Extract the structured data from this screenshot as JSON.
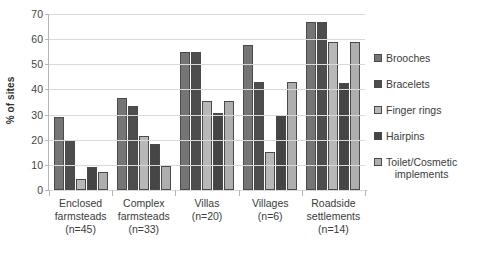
{
  "chart_data": {
    "type": "bar",
    "title": "",
    "xlabel": "",
    "ylabel": "% of sites",
    "ylim": [
      0,
      70
    ],
    "yticks": [
      0,
      10,
      20,
      30,
      40,
      50,
      60,
      70
    ],
    "grid": true,
    "legend_position": "right",
    "categories": [
      "Enclosed farmsteads (n=45)",
      "Complex farmsteads (n=33)",
      "Villas (n=20)",
      "Villages (n=6)",
      "Roadside settlements (n=14)"
    ],
    "category_lines": [
      [
        "Enclosed",
        "farmsteads",
        "(n=45)"
      ],
      [
        "Complex",
        "farmsteads",
        "(n=33)"
      ],
      [
        "Villas",
        "(n=20)"
      ],
      [
        "Villages",
        "(n=6)"
      ],
      [
        "Roadside",
        "settlements",
        "(n=14)"
      ]
    ],
    "series": [
      {
        "name": "Brooches",
        "color": "#757575",
        "values": [
          29,
          36.5,
          55,
          57.5,
          67
        ]
      },
      {
        "name": "Bracelets",
        "color": "#4d4d4d",
        "values": [
          20,
          33.5,
          55,
          43,
          67
        ]
      },
      {
        "name": "Finger rings",
        "color": "#b8b8b8",
        "values": [
          4.5,
          21.5,
          35.5,
          15,
          59
        ]
      },
      {
        "name": "Hairpins",
        "color": "#454545",
        "values": [
          9,
          18.5,
          30.5,
          29.5,
          42.5
        ]
      },
      {
        "name": "Toilet/Cosmetic implements",
        "color": "#aeaeae",
        "values": [
          7,
          9.5,
          35.5,
          43,
          59
        ]
      }
    ],
    "legend_entries": [
      {
        "label": "Brooches",
        "label_line2": ""
      },
      {
        "label": "Bracelets",
        "label_line2": ""
      },
      {
        "label": "Finger rings",
        "label_line2": ""
      },
      {
        "label": "Hairpins",
        "label_line2": ""
      },
      {
        "label": "Toilet/Cosmetic",
        "label_line2": "implements"
      }
    ]
  }
}
